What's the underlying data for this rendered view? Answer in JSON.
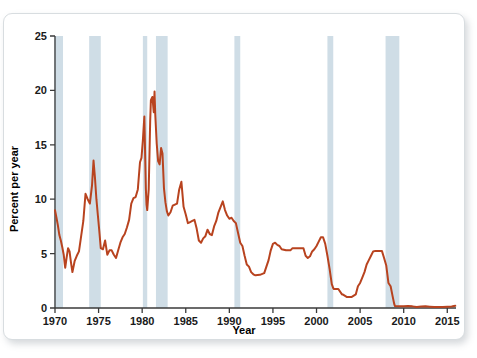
{
  "figure": {
    "background_color": "#ffffff",
    "border_color": "#d8dde0"
  },
  "chart_data": {
    "type": "line",
    "title": "",
    "subtitle": "",
    "xlabel": "Year",
    "ylabel": "Percent per year",
    "xlim": [
      1970,
      2016
    ],
    "ylim": [
      0,
      25
    ],
    "grid": false,
    "legend": null,
    "line_color": "#b8431f",
    "line_width": 2.0,
    "xticks": [
      1970,
      1975,
      1980,
      1985,
      1990,
      1995,
      2000,
      2005,
      2010,
      2015
    ],
    "xtick_labels": [
      "1970",
      "1975",
      "1980",
      "1985",
      "1990",
      "1995",
      "2000",
      "2005",
      "2010",
      "2015"
    ],
    "yticks": [
      0,
      5,
      10,
      15,
      20,
      25
    ],
    "ytick_labels": [
      "0",
      "5",
      "10",
      "15",
      "20",
      "25"
    ],
    "shaded_bands": {
      "name": "recession-bands",
      "color": "#cfdde6",
      "intervals": [
        [
          1969.92,
          1970.92
        ],
        [
          1973.92,
          1975.25
        ],
        [
          1980.08,
          1980.58
        ],
        [
          1981.58,
          1982.92
        ],
        [
          1990.58,
          1991.25
        ],
        [
          2001.25,
          2001.92
        ],
        [
          2007.92,
          2009.5
        ]
      ]
    },
    "series": [
      {
        "name": "Federal funds rate",
        "color": "#b8431f",
        "x": [
          1970.0,
          1970.17,
          1970.33,
          1970.5,
          1970.67,
          1970.83,
          1971.0,
          1971.17,
          1971.33,
          1971.5,
          1971.67,
          1971.83,
          1972.0,
          1972.25,
          1972.5,
          1972.75,
          1973.0,
          1973.25,
          1973.5,
          1973.75,
          1974.0,
          1974.25,
          1974.42,
          1974.58,
          1974.75,
          1974.92,
          1975.08,
          1975.25,
          1975.5,
          1975.75,
          1976.0,
          1976.25,
          1976.5,
          1976.75,
          1977.0,
          1977.25,
          1977.5,
          1977.75,
          1978.0,
          1978.25,
          1978.5,
          1978.75,
          1979.0,
          1979.25,
          1979.5,
          1979.75,
          1979.92,
          1980.08,
          1980.25,
          1980.42,
          1980.5,
          1980.58,
          1980.75,
          1980.92,
          1981.0,
          1981.17,
          1981.33,
          1981.42,
          1981.5,
          1981.67,
          1981.83,
          1982.0,
          1982.17,
          1982.33,
          1982.5,
          1982.67,
          1982.83,
          1983.0,
          1983.25,
          1983.5,
          1983.75,
          1984.0,
          1984.25,
          1984.5,
          1984.75,
          1985.0,
          1985.25,
          1985.5,
          1985.75,
          1986.0,
          1986.25,
          1986.5,
          1986.75,
          1987.0,
          1987.25,
          1987.5,
          1987.75,
          1988.0,
          1988.25,
          1988.5,
          1988.75,
          1989.0,
          1989.25,
          1989.5,
          1989.75,
          1990.0,
          1990.25,
          1990.5,
          1990.75,
          1991.0,
          1991.25,
          1991.5,
          1991.75,
          1992.0,
          1992.25,
          1992.5,
          1992.75,
          1993.0,
          1993.5,
          1994.0,
          1994.25,
          1994.5,
          1994.75,
          1995.0,
          1995.25,
          1995.5,
          1995.75,
          1996.0,
          1996.5,
          1997.0,
          1997.25,
          1997.5,
          1998.0,
          1998.5,
          1998.75,
          1999.0,
          1999.25,
          1999.5,
          1999.75,
          2000.0,
          2000.25,
          2000.5,
          2000.75,
          2001.0,
          2001.25,
          2001.5,
          2001.75,
          2001.92,
          2002.0,
          2002.5,
          2002.92,
          2003.0,
          2003.5,
          2003.75,
          2004.0,
          2004.5,
          2004.75,
          2005.0,
          2005.25,
          2005.5,
          2005.75,
          2006.0,
          2006.25,
          2006.5,
          2006.75,
          2007.0,
          2007.5,
          2007.75,
          2008.0,
          2008.25,
          2008.5,
          2008.75,
          2008.92,
          2009.0,
          2009.5,
          2010.0,
          2010.5,
          2011.0,
          2011.5,
          2012.0,
          2012.5,
          2013.0,
          2013.5,
          2014.0,
          2014.5,
          2015.0,
          2015.5,
          2015.92
        ],
        "y": [
          8.98,
          8.3,
          7.6,
          6.7,
          6.2,
          5.6,
          4.9,
          3.7,
          4.6,
          5.5,
          5.2,
          4.2,
          3.3,
          4.3,
          4.8,
          5.2,
          6.6,
          8.0,
          10.5,
          10.0,
          9.6,
          11.3,
          13.55,
          12.0,
          10.0,
          8.5,
          7.1,
          5.5,
          5.4,
          6.2,
          4.9,
          5.3,
          5.3,
          4.9,
          4.6,
          5.3,
          6.0,
          6.5,
          6.8,
          7.4,
          8.1,
          9.6,
          10.1,
          10.2,
          10.9,
          13.4,
          13.8,
          15.4,
          17.6,
          10.98,
          9.5,
          9.0,
          10.9,
          17.2,
          19.1,
          19.4,
          18.0,
          19.9,
          17.8,
          15.1,
          13.5,
          13.2,
          14.7,
          14.2,
          11.0,
          9.7,
          8.9,
          8.5,
          8.8,
          9.4,
          9.5,
          9.6,
          10.9,
          11.6,
          9.3,
          8.6,
          7.8,
          7.9,
          8.0,
          8.1,
          7.3,
          6.2,
          6.0,
          6.4,
          6.6,
          7.2,
          6.8,
          6.7,
          7.5,
          8.0,
          8.8,
          9.3,
          9.8,
          9.0,
          8.5,
          8.2,
          8.3,
          8.0,
          7.8,
          6.9,
          6.0,
          5.7,
          4.8,
          4.0,
          3.8,
          3.3,
          3.1,
          3.0,
          3.05,
          3.2,
          3.8,
          4.4,
          5.3,
          5.9,
          6.0,
          5.8,
          5.7,
          5.4,
          5.3,
          5.3,
          5.5,
          5.5,
          5.5,
          5.5,
          4.8,
          4.6,
          4.75,
          5.2,
          5.4,
          5.7,
          6.1,
          6.5,
          6.5,
          5.9,
          4.8,
          3.6,
          2.2,
          1.82,
          1.75,
          1.75,
          1.25,
          1.25,
          1.0,
          1.0,
          1.0,
          1.25,
          2.0,
          2.3,
          2.8,
          3.3,
          4.0,
          4.4,
          4.8,
          5.2,
          5.25,
          5.25,
          5.25,
          4.6,
          3.9,
          2.3,
          2.0,
          1.0,
          0.35,
          0.18,
          0.16,
          0.15,
          0.18,
          0.15,
          0.1,
          0.14,
          0.15,
          0.12,
          0.09,
          0.09,
          0.1,
          0.12,
          0.14,
          0.2
        ]
      }
    ]
  }
}
